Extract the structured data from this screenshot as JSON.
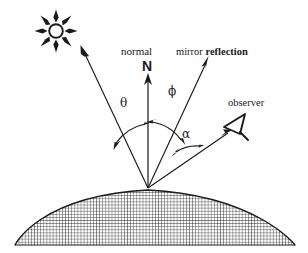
{
  "diagram": {
    "type": "optics-reflection-geometry",
    "background_color": "#ffffff",
    "ink_color": "#1a1a1a",
    "labels": {
      "normal": "normal",
      "normal_vector": "N",
      "mirror": "mirror",
      "reflection": "reflection",
      "observer": "observer",
      "angle_theta": "θ",
      "angle_phi": "ϕ",
      "angle_alpha": "α"
    },
    "icons": {
      "sun": "sun-icon",
      "eye": "observer-eye-icon",
      "normal_arrow": "normal-arrow-icon",
      "incident_ray_arrow": "incident-ray-arrow-icon",
      "mirror_ray_arrow": "mirror-reflection-arrow-icon",
      "observer_ray_arrow": "observer-ray-arrow-icon",
      "surface": "hatched-dome-surface"
    },
    "geometry": {
      "vertex": [
        148,
        188
      ],
      "sun_center": [
        56,
        31
      ],
      "sun_radius": 7,
      "sun_spikes": 8,
      "normal_tip": [
        148,
        78
      ],
      "incident_ray_tip": [
        85,
        53
      ],
      "mirror_ray_tip": [
        207,
        62
      ],
      "observer_ray_tip": [
        230,
        132
      ],
      "eye_position": [
        233,
        128
      ],
      "dome_left": [
        15,
        245
      ],
      "dome_right": [
        295,
        245
      ],
      "dome_apex": [
        148,
        190
      ],
      "hatch_spacing": 3.1
    },
    "angles": {
      "theta_label_pos": [
        125,
        104
      ],
      "phi_label_pos": [
        173,
        92
      ],
      "alpha_label_pos": [
        187,
        135
      ]
    }
  }
}
